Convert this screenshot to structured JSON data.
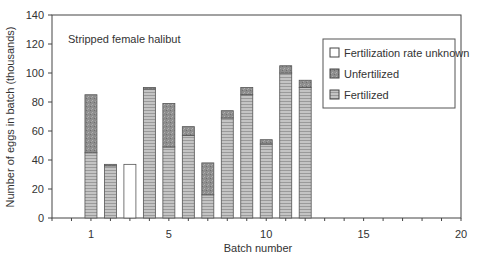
{
  "chart_data": {
    "type": "bar",
    "stacked": true,
    "title": "",
    "annotation": "Stripped female halibut",
    "xlabel": "Batch number",
    "ylabel": "Number of eggs in batch (thousands)",
    "xlim": [
      -1,
      20
    ],
    "ylim": [
      0,
      140
    ],
    "xticks": [
      1,
      5,
      10,
      15,
      20
    ],
    "yticks": [
      0,
      20,
      40,
      60,
      80,
      100,
      120,
      140
    ],
    "grid": false,
    "legend_position": "upper right",
    "categories": [
      1,
      2,
      3,
      4,
      5,
      6,
      7,
      8,
      9,
      10,
      11,
      12
    ],
    "series": [
      {
        "name": "Fertilized",
        "color": "#b8b8b8",
        "values": [
          45,
          36,
          0,
          89,
          49,
          57,
          16,
          69,
          85,
          51,
          100,
          90
        ]
      },
      {
        "name": "Unfertilized",
        "color": "#8c8c8c",
        "values": [
          40,
          1,
          0,
          1,
          30,
          6,
          22,
          5,
          5,
          3,
          5,
          5
        ]
      },
      {
        "name": "Fertilization rate unknown",
        "color": "#ffffff",
        "values": [
          0,
          0,
          37,
          0,
          0,
          0,
          0,
          0,
          0,
          0,
          0,
          0
        ]
      }
    ],
    "totals": [
      85,
      37,
      37,
      90,
      79,
      63,
      38,
      74,
      90,
      54,
      105,
      95
    ]
  },
  "legend": {
    "items": [
      {
        "label": "Fertilization rate unknown",
        "key": "unknown"
      },
      {
        "label": "Unfertilized",
        "key": "unfertilized"
      },
      {
        "label": "Fertilized",
        "key": "fertilized"
      }
    ]
  }
}
